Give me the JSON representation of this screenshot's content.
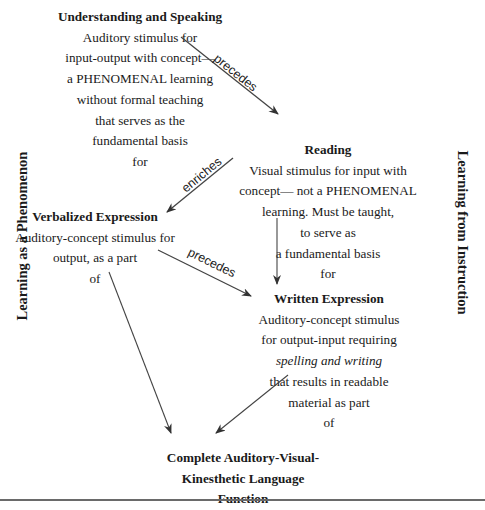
{
  "diagram": {
    "side_labels": {
      "left": "Learning as a Phenomenon",
      "right": "Learning from Instruction"
    },
    "nodes": {
      "understanding": {
        "title": "Understanding and Speaking",
        "lines": [
          "Auditory stimulus for",
          "input-output with concept—",
          "a PHENOMENAL learning",
          "without formal teaching",
          "that serves as the",
          "fundamental basis",
          "for"
        ]
      },
      "reading": {
        "title": "Reading",
        "lines": [
          "Visual stimulus for input with",
          "concept— not a PHENOMENAL",
          "learning. Must be taught,",
          "to serve as",
          "a fundamental basis",
          "for"
        ]
      },
      "verbalized": {
        "title": "Verbalized Expression",
        "lines": [
          "Auditory-concept stimulus for",
          "output, as a part",
          "of"
        ]
      },
      "written": {
        "title": "Written Expression",
        "lines": [
          "Auditory-concept stimulus",
          "for output-input requiring",
          "spelling and writing",
          "that results in readable",
          "material as part",
          "of"
        ]
      },
      "complete": {
        "title_lines": [
          "Complete Auditory-Visual-",
          "Kinesthetic Language",
          "Function"
        ]
      }
    },
    "edges": [
      {
        "from": "understanding",
        "to": "reading",
        "label": "precedes"
      },
      {
        "from": "reading",
        "to": "verbalized",
        "label": "enriches"
      },
      {
        "from": "reading",
        "to": "written",
        "label": ""
      },
      {
        "from": "verbalized",
        "to": "written",
        "label": "precedes"
      },
      {
        "from": "verbalized",
        "to": "complete",
        "label": ""
      },
      {
        "from": "written",
        "to": "complete",
        "label": ""
      }
    ],
    "colors": {
      "text": "#1a1a1a",
      "arrow": "#444444",
      "rule": "#6a6a6a",
      "background": "#ffffff"
    }
  }
}
